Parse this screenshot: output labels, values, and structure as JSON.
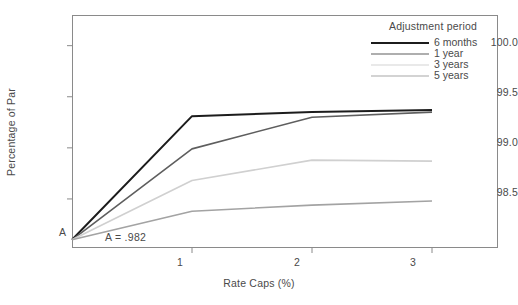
{
  "chart_data": {
    "type": "line",
    "title": "",
    "xlabel": "Rate Caps (%)",
    "ylabel": "Percentage of Par",
    "xlim": [
      0,
      3.55
    ],
    "ylim": [
      98.02,
      100.3
    ],
    "xticks": [
      1,
      2,
      3
    ],
    "xtick_labels": [
      "1",
      "2",
      "3"
    ],
    "yticks": [
      98.5,
      99.0,
      99.5,
      100.0
    ],
    "ytick_labels": [
      "98.5",
      "99.0",
      "99.5",
      "100.0"
    ],
    "grid": false,
    "legend_position": "top-right",
    "legend_title": "Adjustment period",
    "origin_label": "A",
    "annotation": "A = .982",
    "origin_value": 98.2,
    "x": [
      0,
      1,
      2,
      3
    ],
    "series": [
      {
        "name": "6 months",
        "color": "#1c1c1c",
        "width": 2.0,
        "values": [
          98.1,
          99.31,
          99.35,
          99.37
        ]
      },
      {
        "name": "1 year",
        "color": "#5e5e5e",
        "width": 1.6,
        "values": [
          98.1,
          98.99,
          99.3,
          99.35
        ]
      },
      {
        "name": "3 years",
        "color": "#d0d0d0",
        "width": 1.6,
        "values": [
          98.1,
          98.68,
          98.88,
          98.87
        ]
      },
      {
        "name": "5 years",
        "color": "#a3a3a3",
        "width": 1.6,
        "values": [
          98.1,
          98.38,
          98.44,
          98.48
        ]
      }
    ]
  },
  "axes": {
    "y_labels": [
      {
        "text": "100.0",
        "top": 37
      },
      {
        "text": "99.5",
        "top": 87
      },
      {
        "text": "99.0",
        "top": 137
      },
      {
        "text": "98.5",
        "top": 187
      }
    ],
    "x_labels": [
      {
        "text": "1",
        "left": 165
      },
      {
        "text": "2",
        "left": 282
      },
      {
        "text": "3",
        "left": 398
      }
    ]
  },
  "legend": {
    "title": "Adjustment period",
    "items": [
      {
        "label": "6 months",
        "color": "#1c1c1c",
        "thickness": "2.2px"
      },
      {
        "label": "1 year",
        "color": "#5e5e5e",
        "thickness": "1.6px"
      },
      {
        "label": "3 years",
        "color": "#d4d4d4",
        "thickness": "1.6px"
      },
      {
        "label": "5 years",
        "color": "#a8a8a8",
        "thickness": "1.6px"
      }
    ]
  },
  "annotations": {
    "origin_marker": "A",
    "origin_note": "A = .982"
  }
}
